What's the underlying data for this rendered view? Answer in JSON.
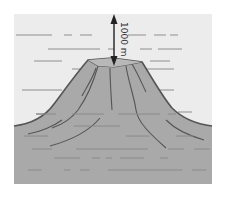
{
  "diagram": {
    "depth_label": "1000 m",
    "colors": {
      "water": "#ececec",
      "mountain": "#a9a9a9",
      "outline": "#555555",
      "water_lines": "#8e8e8e",
      "seafloor_lines": "#8a8a8a",
      "arrow": "#222222"
    }
  }
}
